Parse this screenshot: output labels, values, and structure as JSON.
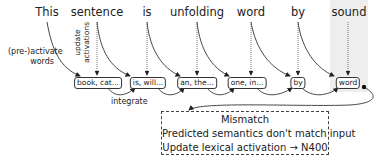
{
  "diagram": {
    "sentence_words": [
      "This",
      "sentence",
      "is",
      "unfolding",
      "word",
      "by",
      "sound"
    ],
    "highlighted_word": "sound",
    "prediction_boxes": [
      "book, cat...",
      "is, will...",
      "an, the...",
      "one, in...",
      "by",
      "word"
    ],
    "labels": {
      "preactivate": [
        "(pre-)activate",
        "words"
      ],
      "update": [
        "update",
        "activations"
      ],
      "integrate": "integrate"
    },
    "mismatch_box": {
      "title": "Mismatch",
      "line1": "Predicted semantics don't match input",
      "line2": "Update lexical activation → N400"
    },
    "colors": {
      "shade": "#eeeeee",
      "line": "#333333",
      "text": "#222222"
    }
  }
}
